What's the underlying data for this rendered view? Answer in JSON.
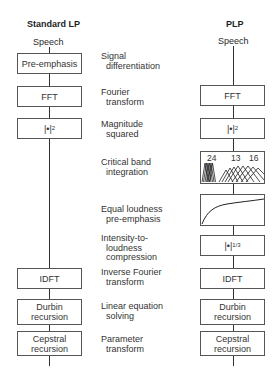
{
  "left": {
    "title": "Standard LP",
    "input": "Speech",
    "blocks": [
      {
        "label": "Pre-emphasis"
      },
      {
        "label": "FFT"
      },
      {
        "label": "|•|",
        "sup": "2"
      },
      {
        "label": "IDFT"
      },
      {
        "label": "Durbin\nrecursion"
      },
      {
        "label": "Cepstral\nrecursion"
      }
    ]
  },
  "right": {
    "title": "PLP",
    "input": "Speech",
    "blocks": [
      {
        "label": "FFT"
      },
      {
        "label": "|•|",
        "sup": "2"
      },
      {
        "label": "critical-band-filterbank-graphic",
        "numbers": [
          "24",
          "13",
          "16"
        ]
      },
      {
        "label": "equal-loudness-curve-graphic"
      },
      {
        "label": "|•|",
        "sup": "1/3"
      },
      {
        "label": "IDFT"
      },
      {
        "label": "Durbin\nrecursion"
      },
      {
        "label": "Cepstral\nrecursion"
      }
    ]
  },
  "descriptions": [
    {
      "line1": "Signal",
      "line2": "differentiation"
    },
    {
      "line1": "Fourier",
      "line2": "transform"
    },
    {
      "line1": "Magnitude",
      "line2": "squared"
    },
    {
      "line1": "Critical band",
      "line2": "integration"
    },
    {
      "line1": "Equal loudness",
      "line2": "pre-emphasis"
    },
    {
      "line1": "Intensity-to-",
      "line2": "loudness",
      "line3": "compression"
    },
    {
      "line1": "Inverse Fourier",
      "line2": "transform"
    },
    {
      "line1": "Linear equation",
      "line2": "solving"
    },
    {
      "line1": "Parameter",
      "line2": "transform"
    }
  ]
}
